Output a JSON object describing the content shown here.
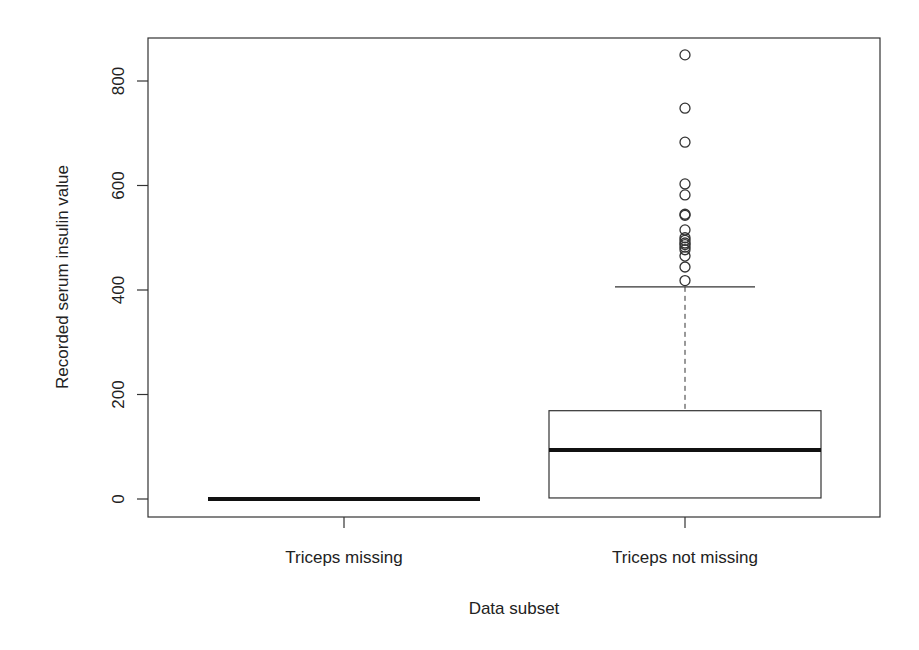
{
  "chart_data": {
    "type": "box",
    "title": "",
    "xlabel": "Data subset",
    "ylabel": "Recorded serum insulin value",
    "categories": [
      "Triceps missing",
      "Triceps not missing"
    ],
    "ylim": [
      -32,
      885
    ],
    "yticks": [
      0,
      200,
      400,
      600,
      800
    ],
    "grid": false,
    "legend": null,
    "boxes": [
      {
        "name": "Triceps missing",
        "min": 0,
        "q1": 0,
        "median": 0,
        "q3": 0,
        "max": 0,
        "outliers": []
      },
      {
        "name": "Triceps not missing",
        "min": 0,
        "q1": 2,
        "median": 94,
        "q3": 169,
        "max": 406,
        "outliers": [
          418,
          444,
          465,
          477,
          482,
          487,
          490,
          495,
          500,
          515,
          543,
          545,
          582,
          603,
          683,
          748,
          850
        ]
      }
    ]
  }
}
